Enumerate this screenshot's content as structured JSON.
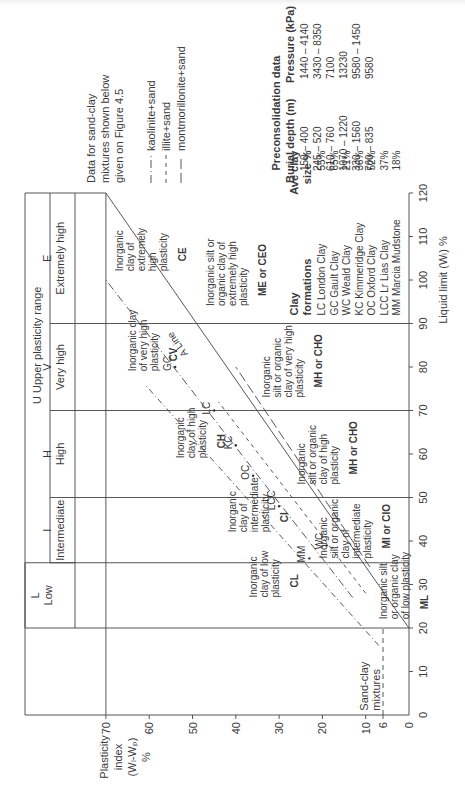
{
  "page_header_faint": "",
  "chart_data": {
    "type": "line",
    "xlabel": "Liquid limit (W_L) %",
    "ylabel": "Plasticity index (W_L-W_P) %",
    "xlim": [
      0,
      120
    ],
    "ylim": [
      0,
      70
    ],
    "x_ticks": [
      10,
      20,
      30,
      40,
      50,
      60,
      70,
      80,
      90,
      100,
      110,
      120
    ],
    "y_ticks": [
      0,
      6,
      10,
      20,
      30,
      40,
      50,
      60,
      70
    ],
    "grid": false,
    "a_line": {
      "label": "A Line",
      "points": [
        [
          20,
          0
        ],
        [
          25.5,
          4
        ],
        [
          120,
          73
        ]
      ]
    },
    "u_line_hint": {
      "points": [
        [
          16,
          7
        ],
        [
          76,
          61
        ]
      ],
      "style": "dash-dot"
    },
    "zone_boundaries_ll": [
      20,
      35,
      50,
      70,
      90
    ],
    "sand_clay_line_pi": 6,
    "plasticity_ranges": [
      {
        "letter": "L",
        "name": "Low",
        "from": 20,
        "to": 35
      },
      {
        "letter": "I",
        "name": "Intermediate",
        "from": 35,
        "to": 50
      },
      {
        "letter": "H",
        "name": "High",
        "from": 50,
        "to": 70
      },
      {
        "letter": "V",
        "name": "Very high",
        "from": 70,
        "to": 90
      },
      {
        "letter": "E",
        "name": "Extremely high",
        "from": 90,
        "to": 120
      }
    ],
    "upper_range_label": "U   Upper   plasticity   range",
    "zones": [
      {
        "text": [
          "Inorganic",
          "clay of low",
          "plasticity"
        ],
        "code": "CL",
        "ll": 27,
        "pi": 35
      },
      {
        "text": [
          "Inorganic",
          "clay of",
          "intermediate",
          "plasticity"
        ],
        "code": "CI",
        "ll": 42,
        "pi": 40
      },
      {
        "text": [
          "Inorganic",
          "clay of high",
          "plasticity"
        ],
        "code": "CH",
        "ll": 59,
        "pi": 52
      },
      {
        "text": [
          "Inorganic clay",
          "of very high",
          "plasticity"
        ],
        "code": "CV",
        "ll": 79,
        "pi": 63
      },
      {
        "text": [
          "Inorganic",
          "clay of",
          "extremely",
          "high",
          "plasticity"
        ],
        "code": "CE",
        "ll": 102,
        "pi": 66
      },
      {
        "text": [
          "Inorganic silt",
          "or organic clay",
          "of low plasticity"
        ],
        "code": "ML",
        "ll": 22,
        "pi": 5
      },
      {
        "text": [
          "Inorganic",
          "silt or organic",
          "clay of",
          "intermediate",
          "plasticity"
        ],
        "code": "MI or CIO",
        "ll": 36,
        "pi": 19
      },
      {
        "text": [
          "Inorganic",
          "silt or organic",
          "clay of high",
          "plasticity"
        ],
        "code": "MH or CHO",
        "ll": 53,
        "pi": 24
      },
      {
        "text": [
          "Inorganic",
          "silt or organic",
          "clay of very high",
          "plasticity"
        ],
        "code": "MH or CHO",
        "ll": 73,
        "pi": 32
      },
      {
        "text": [
          "Inorganic silt or",
          "organic clay of",
          "extremely high",
          "plasticity"
        ],
        "code": "ME or CEO",
        "ll": 94,
        "pi": 45
      }
    ],
    "sand_clay_label": [
      "Sand-clay",
      "mixtures"
    ],
    "clay_points": [
      {
        "label": "LC",
        "ll": 70,
        "pi": 45
      },
      {
        "label": "GC",
        "ll": 80,
        "pi": 54
      },
      {
        "label": "WC",
        "ll": 39,
        "pi": 19
      },
      {
        "label": "KC",
        "ll": 62,
        "pi": 40
      },
      {
        "label": "OC",
        "ll": 55,
        "pi": 36
      },
      {
        "label": "LCC",
        "ll": 48,
        "pi": 30
      },
      {
        "label": "MM",
        "ll": 36,
        "pi": 23
      }
    ],
    "series": [
      {
        "name": "kaolinite+sand",
        "style": "dash-dot",
        "points": [
          [
            27,
            13
          ],
          [
            100,
            70
          ]
        ]
      },
      {
        "name": "illite+sand",
        "style": "short-dash",
        "points": [
          [
            28,
            10
          ],
          [
            72,
            44
          ]
        ]
      },
      {
        "name": "montmorillonite+sand",
        "style": "long-dash",
        "points": [
          [
            34,
            9
          ],
          [
            80,
            40
          ]
        ]
      }
    ]
  },
  "legend": {
    "note_lines": [
      "Data for sand-clay",
      "mixtures shown below",
      "given on Figure 4.5"
    ],
    "items": [
      "kaolinite+sand",
      "illite+sand",
      "montmorillonite+sand"
    ]
  },
  "preconsolidation": {
    "title": "Preconsolidation data",
    "headers": [
      "Burial depth (m)",
      "Pressure (kPa)"
    ],
    "rows": [
      [
        "150 – 400",
        "1440 – 4140"
      ],
      [
        "245 – 520",
        "3430 – 8350"
      ],
      [
        "610 – 760",
        "7100"
      ],
      [
        "1070 – 1220",
        "13230"
      ],
      [
        "330 – 1560",
        "9580 – 1450"
      ],
      [
        "760 – 835",
        "9580"
      ]
    ]
  },
  "clay_formations": {
    "headers": [
      "Clay",
      "formations",
      "Ave clay",
      "size %"
    ],
    "rows": [
      [
        "LC London Clay",
        "55%"
      ],
      [
        "GC Gault Clay",
        "65%"
      ],
      [
        "WC Weald Clay",
        "21%"
      ],
      [
        "KC Kimmeridge Clay",
        "36%"
      ],
      [
        "OC Oxford Clay",
        "52%"
      ],
      [
        "LCC Lr Lias Clay",
        "37%"
      ],
      [
        "MM Marcia Mudstone",
        "18%"
      ]
    ]
  },
  "axis_labels": {
    "y": [
      "Plasticity",
      "index",
      "(Wₗ-Wₚ)",
      "%"
    ],
    "x": "Liquid limit (Wₗ) %"
  }
}
